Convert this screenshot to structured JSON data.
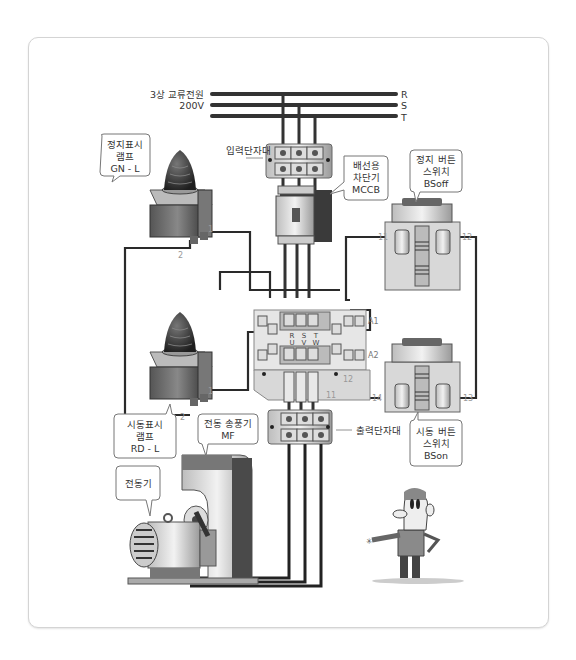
{
  "power_supply": {
    "label_line1": "3상 교류전원",
    "label_line2": "200V",
    "phases": [
      "R",
      "S",
      "T"
    ]
  },
  "terminal_blocks": {
    "input": "입력단자대",
    "output": "출력단자대"
  },
  "callouts": {
    "stop_lamp": [
      "정지표시",
      "램프",
      "GN - L"
    ],
    "mccb": [
      "배선용",
      "차단기",
      "MCCB"
    ],
    "stop_button": [
      "정지 버튼",
      "스위치",
      "BSoff"
    ],
    "start_lamp": [
      "시동표시",
      "램프",
      "RD - L"
    ],
    "blower": [
      "전동 송풍기",
      "MF"
    ],
    "motor": [
      "전동기"
    ],
    "start_button": [
      "시동 버튼",
      "스위치",
      "BSon"
    ]
  },
  "terminals": {
    "lamp_top": [
      "1",
      "2"
    ],
    "lamp_bottom": [
      "1",
      "2"
    ],
    "stop_button": [
      "11",
      "12"
    ],
    "start_button": [
      "14",
      "13"
    ],
    "contactor_coil": [
      "A1",
      "A2"
    ],
    "contactor_input": [
      "R",
      "S",
      "T"
    ],
    "contactor_output": [
      "U",
      "V",
      "W"
    ],
    "relay": [
      "12",
      "11"
    ]
  },
  "colors": {
    "wire": "#2a2a2a",
    "frame_border": "#d4d4d4",
    "device_gray": "#8a8a8a",
    "background": "#ffffff"
  }
}
